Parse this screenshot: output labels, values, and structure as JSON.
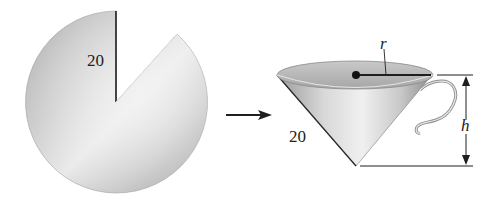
{
  "figure": {
    "sector": {
      "label_radius": "20",
      "colors": {
        "light": "#e8e8e8",
        "mid": "#c4c4c4",
        "dark": "#9a9a9a"
      }
    },
    "arrow": {
      "direction": "right"
    },
    "cone": {
      "label_slant": "20",
      "label_radius": "r",
      "label_height": "h",
      "colors": {
        "rim_top": "#b9b9b9",
        "body_light": "#ececec",
        "body_dark": "#8f8f8f"
      }
    },
    "line_color": "#1e1e1e"
  }
}
